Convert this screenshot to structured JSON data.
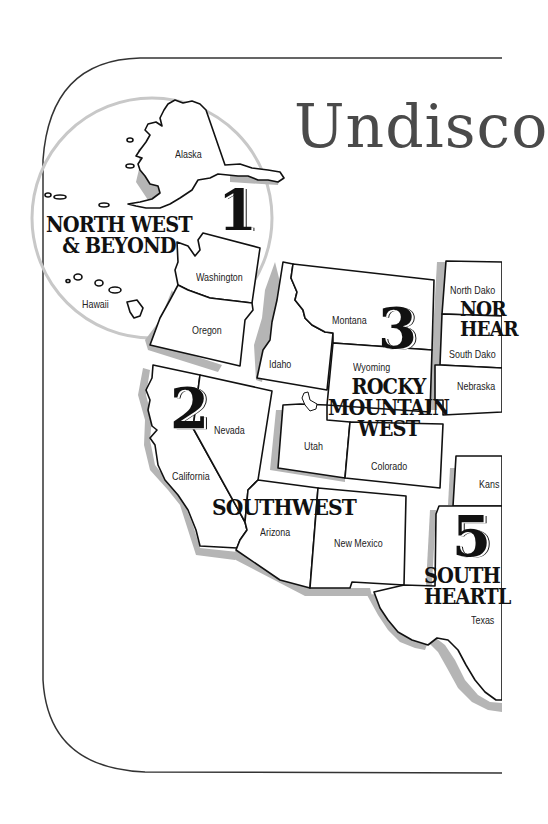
{
  "title": "Undisco",
  "colors": {
    "frame_stroke": "#333333",
    "state_stroke": "#111111",
    "shadow": "#b5b5b5",
    "circle_stroke": "#c8c8c8",
    "title_color": "#4a4a4a",
    "background": "#ffffff"
  },
  "regions": [
    {
      "number": "1",
      "name_line1": "NORTH WEST",
      "name_line2": "& BEYOND",
      "states": [
        "Alaska",
        "Washington",
        "Oregon",
        "Hawaii"
      ]
    },
    {
      "number": "2",
      "name_line1": "SOUTHWEST",
      "states": [
        "California",
        "Nevada",
        "Arizona",
        "New Mexico"
      ]
    },
    {
      "number": "3",
      "name_line1": "ROCKY",
      "name_line2": "MOUNTAIN",
      "name_line3": "WEST",
      "states": [
        "Montana",
        "Idaho",
        "Wyoming",
        "Utah",
        "Colorado"
      ]
    },
    {
      "number": "4",
      "name_line1": "NOR",
      "name_line2": "HEAR",
      "states": [
        "North Dako",
        "South Dako",
        "Nebraska"
      ]
    },
    {
      "number": "5",
      "name_line1": "SOUTH",
      "name_line2": "HEARTL",
      "states": [
        "Kansa",
        "Texas"
      ]
    }
  ],
  "states": {
    "alaska": "Alaska",
    "hawaii": "Hawaii",
    "washington": "Washington",
    "oregon": "Oregon",
    "idaho": "Idaho",
    "montana": "Montana",
    "wyoming": "Wyoming",
    "utah": "Utah",
    "colorado": "Colorado",
    "nevada": "Nevada",
    "california": "California",
    "arizona": "Arizona",
    "new_mexico": "New Mexico",
    "north_dakota": "North Dako",
    "south_dakota": "South Dako",
    "nebraska": "Nebraska",
    "kansas": "Kans",
    "texas": "Texas"
  }
}
